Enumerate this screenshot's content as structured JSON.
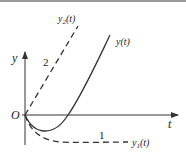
{
  "diagram": {
    "axes": {
      "y_label": "y",
      "x_label": "t",
      "origin_label": "O"
    },
    "curves": [
      {
        "id": "y2",
        "label_base": "y",
        "label_sub": "2",
        "label_tail": "(t)",
        "marker": "2",
        "style": "dashed"
      },
      {
        "id": "y",
        "label": "y(t)",
        "style": "solid"
      },
      {
        "id": "y1",
        "label_base": "y",
        "label_sub": "1",
        "label_tail": "(t)",
        "marker": "1",
        "style": "dashed"
      }
    ],
    "colors": {
      "stroke": "#333333",
      "frame": "#9a9a9a"
    }
  }
}
